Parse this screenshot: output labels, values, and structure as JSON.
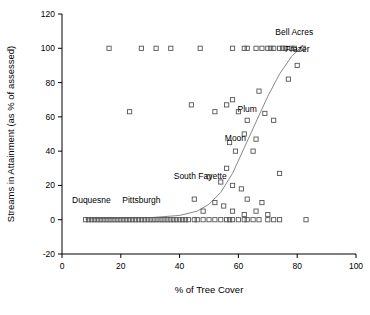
{
  "chart_data": {
    "type": "scatter",
    "title": "",
    "xlabel": "% of Tree Cover",
    "ylabel": "Streams in Attainment (as % of assessed)",
    "xlim": [
      0,
      100
    ],
    "ylim": [
      -20,
      120
    ],
    "xticks": [
      "0",
      "20",
      "40",
      "60",
      "80",
      "100"
    ],
    "yticks": [
      "-20",
      "0",
      "20",
      "40",
      "60",
      "80",
      "100",
      "120"
    ],
    "grid": false,
    "legend": "none",
    "marker_style": "open-square",
    "points": [
      [
        8,
        0
      ],
      [
        9,
        0
      ],
      [
        10,
        0
      ],
      [
        11,
        0
      ],
      [
        12,
        0
      ],
      [
        13,
        0
      ],
      [
        14,
        0
      ],
      [
        15,
        0
      ],
      [
        16,
        0
      ],
      [
        17,
        0
      ],
      [
        18,
        0
      ],
      [
        19,
        0
      ],
      [
        20,
        0
      ],
      [
        21,
        0
      ],
      [
        22,
        0
      ],
      [
        23,
        0
      ],
      [
        24,
        0
      ],
      [
        25,
        0
      ],
      [
        26,
        0
      ],
      [
        27,
        0
      ],
      [
        28,
        0
      ],
      [
        29,
        0
      ],
      [
        30,
        0
      ],
      [
        31,
        0
      ],
      [
        32,
        0
      ],
      [
        33,
        0
      ],
      [
        34,
        0
      ],
      [
        35,
        0
      ],
      [
        36,
        0
      ],
      [
        37,
        0
      ],
      [
        38,
        0
      ],
      [
        39,
        0
      ],
      [
        40,
        0
      ],
      [
        41,
        0
      ],
      [
        42,
        0
      ],
      [
        43,
        0
      ],
      [
        45,
        0
      ],
      [
        46,
        0
      ],
      [
        48,
        0
      ],
      [
        50,
        0
      ],
      [
        52,
        0
      ],
      [
        54,
        0
      ],
      [
        56,
        0
      ],
      [
        57,
        0
      ],
      [
        58,
        0
      ],
      [
        60,
        0
      ],
      [
        62,
        0
      ],
      [
        63,
        0
      ],
      [
        65,
        0
      ],
      [
        67,
        0
      ],
      [
        70,
        0
      ],
      [
        72,
        0
      ],
      [
        74,
        0
      ],
      [
        83,
        0
      ],
      [
        16,
        100
      ],
      [
        27,
        100
      ],
      [
        32,
        100
      ],
      [
        37,
        100
      ],
      [
        47,
        100
      ],
      [
        58,
        100
      ],
      [
        62,
        100
      ],
      [
        63,
        100
      ],
      [
        66,
        100
      ],
      [
        68,
        100
      ],
      [
        70,
        100
      ],
      [
        71,
        100
      ],
      [
        72,
        100
      ],
      [
        74,
        100
      ],
      [
        75,
        100
      ],
      [
        76,
        100
      ],
      [
        78,
        100
      ],
      [
        79,
        100
      ],
      [
        82,
        100
      ],
      [
        23,
        63
      ],
      [
        44,
        67
      ],
      [
        52,
        63
      ],
      [
        56,
        67
      ],
      [
        58,
        70
      ],
      [
        60,
        63
      ],
      [
        63,
        58
      ],
      [
        62,
        50
      ],
      [
        66,
        47
      ],
      [
        57,
        45
      ],
      [
        59,
        40
      ],
      [
        65,
        40
      ],
      [
        67,
        75
      ],
      [
        69,
        62
      ],
      [
        72,
        58
      ],
      [
        77,
        82
      ],
      [
        80,
        90
      ],
      [
        50,
        25
      ],
      [
        54,
        22
      ],
      [
        58,
        20
      ],
      [
        61,
        18
      ],
      [
        63,
        12
      ],
      [
        68,
        10
      ],
      [
        55,
        8
      ],
      [
        52,
        10
      ],
      [
        58,
        5
      ],
      [
        66,
        5
      ],
      [
        70,
        3
      ],
      [
        62,
        3
      ],
      [
        74,
        27
      ],
      [
        56,
        30
      ],
      [
        48,
        5
      ],
      [
        45,
        12
      ]
    ],
    "trend_curve": [
      [
        8,
        0.5
      ],
      [
        20,
        0.8
      ],
      [
        30,
        1.2
      ],
      [
        40,
        2.5
      ],
      [
        46,
        5
      ],
      [
        50,
        9
      ],
      [
        54,
        16
      ],
      [
        58,
        27
      ],
      [
        62,
        42
      ],
      [
        66,
        57
      ],
      [
        70,
        72
      ],
      [
        74,
        85
      ],
      [
        78,
        95
      ],
      [
        82,
        102
      ]
    ],
    "annotations": [
      {
        "text": "Bell Acres",
        "x": 79,
        "y": 108
      },
      {
        "text": "Frazer",
        "x": 80,
        "y": 98
      },
      {
        "text": "Plum",
        "x": 63,
        "y": 63
      },
      {
        "text": "Moon",
        "x": 59,
        "y": 46
      },
      {
        "text": "South Fayette",
        "x": 47,
        "y": 24
      },
      {
        "text": "Pittsburgh",
        "x": 27,
        "y": 10
      },
      {
        "text": "Duquesne",
        "x": 10,
        "y": 10
      }
    ]
  }
}
